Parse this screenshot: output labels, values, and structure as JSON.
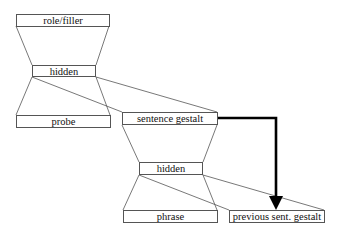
{
  "diagram": {
    "type": "neural-network-architecture",
    "nodes": [
      {
        "id": "role_filler",
        "label": "role/filler"
      },
      {
        "id": "hidden_top",
        "label": "hidden"
      },
      {
        "id": "probe",
        "label": "probe"
      },
      {
        "id": "sentence_gestalt",
        "label": "sentence gestalt"
      },
      {
        "id": "hidden_bottom",
        "label": "hidden"
      },
      {
        "id": "phrase",
        "label": "phrase"
      },
      {
        "id": "previous_sent_gestalt",
        "label": "previous sent. gestalt"
      }
    ],
    "edges": [
      {
        "from": "hidden_top",
        "to": "role_filler",
        "style": "projection"
      },
      {
        "from": "probe",
        "to": "hidden_top",
        "style": "projection"
      },
      {
        "from": "sentence_gestalt",
        "to": "hidden_top",
        "style": "projection"
      },
      {
        "from": "hidden_bottom",
        "to": "sentence_gestalt",
        "style": "projection"
      },
      {
        "from": "phrase",
        "to": "hidden_bottom",
        "style": "projection"
      },
      {
        "from": "previous_sent_gestalt",
        "to": "hidden_bottom",
        "style": "projection"
      },
      {
        "from": "sentence_gestalt",
        "to": "previous_sent_gestalt",
        "style": "bold-arrow-copy"
      }
    ],
    "colors": {
      "line": "#555555",
      "arrow": "#000000",
      "background": "#ffffff"
    }
  }
}
